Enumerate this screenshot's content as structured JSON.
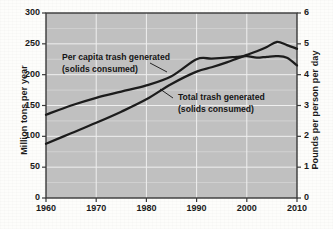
{
  "chart_data": {
    "type": "line",
    "title": "",
    "xlabel": "",
    "ylabel": "Million tons per year",
    "y2label": "Pounds per person per day",
    "xlim": [
      1960,
      2010
    ],
    "ylim": [
      0,
      300
    ],
    "y2lim": [
      0,
      6
    ],
    "grid": true,
    "legend_position": "inline-annotations",
    "xticks": [
      "1960",
      "1970",
      "1980",
      "1990",
      "2000",
      "2010"
    ],
    "xtick_values": [
      1960,
      1970,
      1980,
      1990,
      2000,
      2010
    ],
    "yticks_left": [
      "0",
      "50",
      "100",
      "150",
      "200",
      "250",
      "300"
    ],
    "ytick_left_values": [
      0,
      50,
      100,
      150,
      200,
      250,
      300
    ],
    "yticks_right": [
      "0",
      "1",
      "2",
      "3",
      "4",
      "5",
      "6"
    ],
    "ytick_right_values": [
      0,
      1,
      2,
      3,
      4,
      5,
      6
    ],
    "series": [
      {
        "name": "Per capita trash generated (solids consumed)",
        "axis": "right",
        "units": "Pounds per person per day",
        "x": [
          1960,
          1965,
          1970,
          1975,
          1980,
          1985,
          1990,
          1993,
          1996,
          1998,
          2000,
          2002,
          2004,
          2006,
          2008,
          2010
        ],
        "values": [
          2.7,
          3.0,
          3.25,
          3.45,
          3.65,
          3.95,
          4.5,
          4.52,
          4.55,
          4.58,
          4.6,
          4.55,
          4.58,
          4.6,
          4.55,
          4.3
        ]
      },
      {
        "name": "Total trash generated (solids consumed)",
        "axis": "left",
        "units": "Million tons per year",
        "x": [
          1960,
          1965,
          1970,
          1975,
          1980,
          1985,
          1990,
          1993,
          1996,
          1998,
          2000,
          2002,
          2004,
          2006,
          2008,
          2010
        ],
        "values": [
          88,
          105,
          122,
          140,
          160,
          185,
          205,
          212,
          220,
          226,
          232,
          238,
          245,
          253,
          248,
          242
        ]
      }
    ],
    "annotations": [
      {
        "name": "per-capita-label",
        "line1": "Per capita trash generated",
        "line2": "(solids consumed)"
      },
      {
        "name": "total-trash-label",
        "line1": "Total trash generated",
        "line2": "(solids consumed)"
      }
    ],
    "colors": {
      "plot_background": "#c0c0c0",
      "gridline": "#efefef",
      "axis_border": "#3a3a3a",
      "series_line": "#1c1c1c",
      "text": "#141414",
      "page_background": "#fdfdfb"
    }
  }
}
